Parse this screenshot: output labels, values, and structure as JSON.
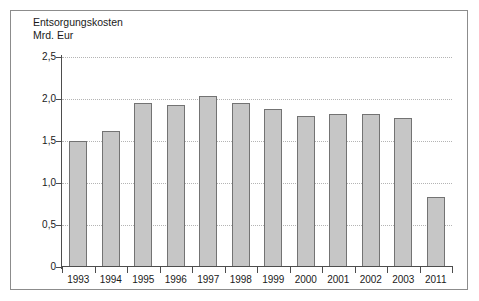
{
  "chart_data": {
    "type": "bar",
    "title": "Entsorgungskosten",
    "subtitle": "Mrd. Eur",
    "xlabel": "",
    "ylabel": "Mrd. Eur",
    "ylim": [
      0,
      2.5
    ],
    "grid": true,
    "legend": "none",
    "ytick_labels": [
      "2,5",
      "2,0",
      "1,5",
      "1,0",
      "0,5",
      "0"
    ],
    "ytick_values": [
      2.5,
      2.0,
      1.5,
      1.0,
      0.5,
      0
    ],
    "categories": [
      "1993",
      "1994",
      "1995",
      "1996",
      "1997",
      "1998",
      "1999",
      "2000",
      "2001",
      "2002",
      "2003",
      "2011"
    ],
    "values": [
      1.5,
      1.62,
      1.95,
      1.93,
      2.03,
      1.95,
      1.88,
      1.8,
      1.82,
      1.82,
      1.77,
      0.83
    ]
  },
  "style": {
    "bar_fill": "#c6c6c6",
    "bar_border": "#737373",
    "grid_color": "#b4b4b4",
    "axis_color": "#4d4d4d",
    "frame_color": "#8c8c8c",
    "text_color": "#1a1a1a"
  }
}
